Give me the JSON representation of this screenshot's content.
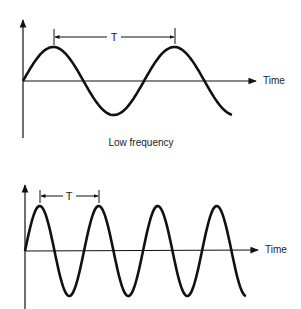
{
  "diagrams": [
    {
      "id": "low",
      "caption": "Low frequency",
      "axis_label": "Time",
      "period_label": "T",
      "origin": [
        23,
        81
      ],
      "amplitude": 34,
      "period": 121,
      "x_end": 232,
      "axis_x_end": 256,
      "axis_y_top": 19,
      "axis_y_bottom": 138,
      "period_marker": {
        "x1": 54,
        "x2": 175,
        "y": 37
      }
    },
    {
      "id": "high",
      "caption": "",
      "axis_label": "Time",
      "period_label": "T",
      "origin": [
        25,
        251
      ],
      "amplitude": 45,
      "period": 59,
      "x_end": 246,
      "axis_x_end": 258,
      "axis_y_top": 184,
      "axis_y_bottom": 309,
      "period_marker": {
        "x1": 40,
        "x2": 99,
        "y": 196
      }
    }
  ],
  "colors": {
    "ink": "#111111",
    "background": "#ffffff"
  }
}
